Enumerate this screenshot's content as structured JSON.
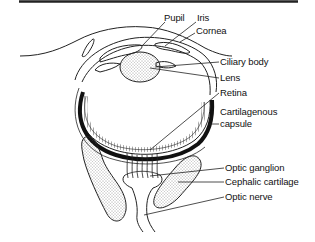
{
  "diagram": {
    "type": "anatomical cross-section of cephalopod eye",
    "labels": [
      {
        "id": "pupil",
        "text": "Pupil",
        "x": 164,
        "y": 17
      },
      {
        "id": "iris",
        "text": "Iris",
        "x": 197,
        "y": 17
      },
      {
        "id": "cornea",
        "text": "Cornea",
        "x": 196,
        "y": 29
      },
      {
        "id": "ciliary-body",
        "text": "Ciliary body",
        "x": 220,
        "y": 58
      },
      {
        "id": "lens",
        "text": "Lens",
        "x": 220,
        "y": 74
      },
      {
        "id": "retina",
        "text": "Retina",
        "x": 220,
        "y": 89
      },
      {
        "id": "cartilagenous",
        "text": "Cartilagenous",
        "x": 220,
        "y": 108
      },
      {
        "id": "capsule",
        "text": "capsule",
        "x": 220,
        "y": 120
      },
      {
        "id": "optic-ganglion",
        "text": "Optic ganglion",
        "x": 225,
        "y": 164
      },
      {
        "id": "cephalic-cartilage",
        "text": "Cephalic cartilage",
        "x": 225,
        "y": 178
      },
      {
        "id": "optic-nerve",
        "text": "Optic nerve",
        "x": 225,
        "y": 193
      }
    ]
  }
}
